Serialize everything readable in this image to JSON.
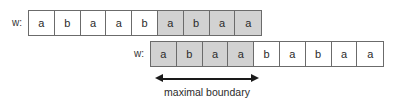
{
  "figure": {
    "title_text": "",
    "colors": {
      "shaded_cell": "#d2d2d2",
      "unshaded_cell": "#ffffff",
      "cell_border": "#6b6b6b",
      "text": "#2b2b2b",
      "arrow": "#1a1a1a",
      "background": "#ffffff"
    }
  },
  "rows": [
    {
      "label": "w:",
      "symbols": [
        "a",
        "b",
        "a",
        "a",
        "b",
        "a",
        "b",
        "a",
        "a"
      ],
      "shaded": [
        false,
        false,
        false,
        false,
        false,
        true,
        true,
        true,
        true
      ],
      "shaded_region": "suffix",
      "shaded_count": 4
    },
    {
      "label": "w:",
      "symbols": [
        "a",
        "b",
        "a",
        "a",
        "b",
        "a",
        "b",
        "a",
        "a"
      ],
      "shaded": [
        true,
        true,
        true,
        true,
        false,
        false,
        false,
        false,
        false
      ],
      "shaded_region": "prefix",
      "shaded_count": 4
    }
  ],
  "annotation": {
    "caption": "maximal boundary",
    "arrow_type": "double-headed-horizontal",
    "spans_cells": 4
  }
}
